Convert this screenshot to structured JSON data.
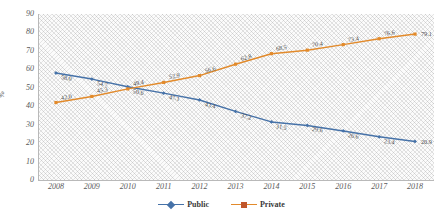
{
  "chart_data": {
    "type": "line",
    "title": "",
    "xlabel": "",
    "ylabel": "%",
    "ylim": [
      0,
      90
    ],
    "yticks": [
      90,
      80,
      70,
      60,
      50,
      40,
      30,
      20,
      10,
      0
    ],
    "grid": false,
    "legend_position": "bottom",
    "categories": [
      "2008",
      "2009",
      "2010",
      "2011",
      "2012",
      "2013",
      "2014",
      "2015",
      "2016",
      "2017",
      "2018"
    ],
    "series": [
      {
        "name": "Public",
        "color": "#4672a8",
        "marker": "diamond",
        "values": [
          58.0,
          54.7,
          50.6,
          47.1,
          43.4,
          37.2,
          31.5,
          29.6,
          26.6,
          23.4,
          20.9
        ],
        "labels": [
          "58.0",
          "54.7",
          "50.6",
          "47.1",
          "43.4",
          "37.2",
          "31.5",
          "29.6",
          "26.6",
          "23.4",
          "20.9"
        ]
      },
      {
        "name": "Private",
        "color": "#e28a2b",
        "marker": "square",
        "values": [
          42.0,
          45.3,
          49.4,
          52.9,
          56.6,
          62.8,
          68.5,
          70.4,
          73.4,
          76.6,
          79.1
        ],
        "labels": [
          "42.0",
          "45.3",
          "49.4",
          "52.9",
          "56.6",
          "62.8",
          "68.5",
          "70.4",
          "73.4",
          "76.6",
          "79.1"
        ]
      }
    ]
  },
  "legend": {
    "items": [
      {
        "label": "Public"
      },
      {
        "label": "Private"
      }
    ]
  },
  "axis": {
    "y_title": "%"
  }
}
